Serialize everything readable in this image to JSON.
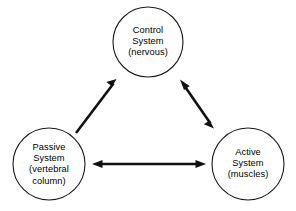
{
  "diagram": {
    "background_color": "#ffffff",
    "stroke_color": "#111111",
    "circle_stroke_color": "#1a1a1a",
    "nodes": [
      {
        "id": "control-system",
        "name": "control-system-node",
        "lines": [
          "Control",
          "System",
          "(nervous)"
        ],
        "line1": "Control",
        "line2": "System",
        "line3": "(nervous)",
        "cx": 148,
        "cy": 42,
        "r": 35
      },
      {
        "id": "passive-system",
        "name": "passive-system-node",
        "lines": [
          "Passive",
          "System",
          "(vertebral",
          "column)"
        ],
        "line1": "Passive",
        "line2": "System",
        "line3": "(vertebral",
        "line4": "column)",
        "cx": 49,
        "cy": 164,
        "r": 36
      },
      {
        "id": "active-system",
        "name": "active-system-node",
        "lines": [
          "Active",
          "System",
          "(muscles)"
        ],
        "line1": "Active",
        "line2": "System",
        "line3": "(muscles)",
        "cx": 248,
        "cy": 164,
        "r": 36
      }
    ],
    "connectors": [
      {
        "id": "passive-to-control",
        "name": "arrow-passive-to-control",
        "from": "passive-system",
        "to": "control-system",
        "heads": "single",
        "direction": "up-right"
      },
      {
        "id": "control-to-active",
        "name": "arrow-control-active",
        "from": "control-system",
        "to": "active-system",
        "heads": "double",
        "direction": "diagonal"
      },
      {
        "id": "passive-to-active",
        "name": "arrow-passive-active",
        "from": "passive-system",
        "to": "active-system",
        "heads": "double",
        "direction": "horizontal"
      }
    ]
  }
}
